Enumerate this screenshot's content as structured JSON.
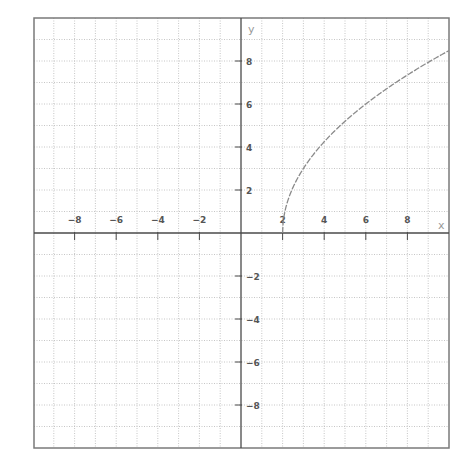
{
  "chart_data": {
    "type": "line",
    "title": "",
    "xlabel": "x",
    "ylabel": "y",
    "xlim": [
      -9.9,
      10
    ],
    "ylim": [
      -10,
      10.2
    ],
    "grid": true,
    "x_ticks": [
      -8,
      -6,
      -4,
      -2,
      2,
      4,
      6,
      8
    ],
    "y_ticks": [
      8,
      6,
      4,
      2,
      -2,
      -4,
      -6,
      -8
    ],
    "x_tick_labels": [
      "-8",
      "-6",
      "-4",
      "-2",
      "2",
      "4",
      "6",
      "8"
    ],
    "y_tick_labels": [
      "8",
      "6",
      "4",
      "2",
      "-2",
      "-4",
      "-6",
      "-8"
    ],
    "series": [
      {
        "name": "y = 3√(x − 2)",
        "x": [
          2,
          2.25,
          2.5,
          3,
          4,
          5,
          6,
          7,
          8,
          9,
          10
        ],
        "y": [
          0,
          1.5,
          2.12,
          3,
          4.24,
          5.2,
          6,
          6.71,
          7.35,
          7.94,
          8.49
        ],
        "color": "#8a8a8a"
      }
    ],
    "legend": null
  },
  "colors": {
    "frame": "#7a7a7a",
    "axis": "#4a4a4a",
    "grid": "#b8b8b8",
    "curve": "#8a8a8a"
  }
}
